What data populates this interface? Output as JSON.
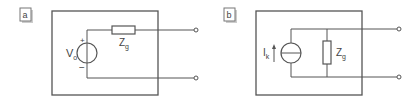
{
  "diagrams": [
    {
      "tag": "a",
      "title": "Voltage source equivalent (Thévenin)",
      "source": {
        "type": "voltage-source",
        "label_main": "V",
        "label_sub": "o",
        "plus": "+",
        "minus": "−"
      },
      "impedance": {
        "type": "series-resistor",
        "label_main": "Z",
        "label_sub": "g"
      }
    },
    {
      "tag": "b",
      "title": "Current source equivalent (Norton)",
      "source": {
        "type": "current-source",
        "label_main": "I",
        "label_sub": "k"
      },
      "impedance": {
        "type": "shunt-resistor",
        "label_main": "Z",
        "label_sub": "g"
      }
    }
  ],
  "colors": {
    "line": "#555555",
    "text": "#444444",
    "background": "#ffffff"
  }
}
